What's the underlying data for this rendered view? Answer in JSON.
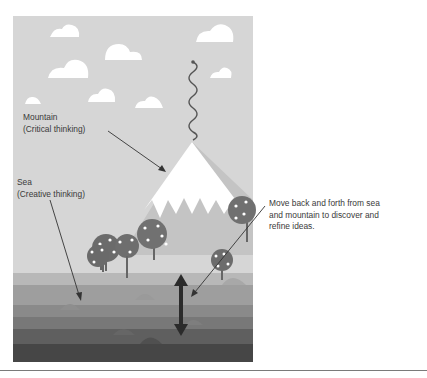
{
  "diagram": {
    "labels": {
      "mountain": {
        "line1": "Mountain",
        "line2": "(Critical thinking)"
      },
      "sea": {
        "line1": "Sea",
        "line2": "(Creative thinking)"
      },
      "note": {
        "line1": "Move back and forth from sea",
        "line2": "and mountain to discover and",
        "line3": "refine ideas."
      }
    },
    "elements": [
      "sky",
      "clouds",
      "squiggle",
      "snow-capped-mountain",
      "trees",
      "sea-layers",
      "double-headed-arrow"
    ],
    "colors": {
      "sky": "#d6d6d6",
      "cloud": "#ffffff",
      "mountain_base": "#c4c4c4",
      "snow": "#ffffff",
      "tree": "#6b6b6b",
      "sea_1": "#b8b8b8",
      "sea_2": "#9e9e9e",
      "sea_3": "#8a8a8a",
      "sea_4": "#787878",
      "sea_5": "#5f5f5f",
      "sea_6": "#464646",
      "arrow": "#2b2b2b",
      "text": "#3a3a3a"
    }
  }
}
